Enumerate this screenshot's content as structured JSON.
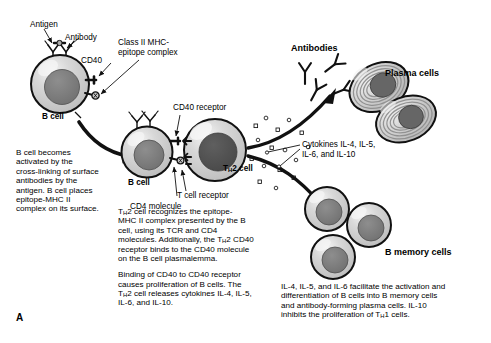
{
  "panel": {
    "label": "A"
  },
  "figure": {
    "title_semantic": "B-cell activation by TH2 cell and differentiation into plasma and memory cells"
  },
  "labels": {
    "antigen": "Antigen",
    "antibody": "Antibody",
    "cd40": "CD40",
    "mhc_complex_line1": "Class II MHC-",
    "mhc_complex_line2": "epitope complex",
    "bcell_1": "B cell",
    "bcell_2": "B cell",
    "cd40_receptor": "CD40 receptor",
    "tcell_receptor": "T cell receptor",
    "cd4_molecule": "CD4 molecule",
    "th2_cell_pre": "T",
    "th2_cell_sub": "H",
    "th2_cell_post": "2 cell",
    "antibodies": "Antibodies",
    "plasma_cells": "Plasma cells",
    "b_memory_cells": "B memory cells",
    "cytokines_line1": "Cytokines IL-4, IL-5,",
    "cytokines_line2": "IL-6, and IL-10"
  },
  "text_blocks": {
    "left": [
      "B cell becomes",
      "activated by the",
      "cross-linking of surface",
      "antibodies by the",
      "antigen. B cell places",
      "epitope-MHC II",
      "complex on its surface."
    ],
    "center_para1": [
      {
        "pre": "T",
        "sub": "H",
        "post": "2 cell recognizes the epitope-"
      },
      {
        "pre": "",
        "sub": "",
        "post": "MHC II complex presented by the B"
      },
      {
        "pre": "",
        "sub": "",
        "post": "cell, using its TCR and CD4"
      },
      {
        "pre": "molecules. Additionally, the T",
        "sub": "H",
        "post": "2 CD40"
      },
      {
        "pre": "",
        "sub": "",
        "post": "receptor binds to the CD40 molecule"
      },
      {
        "pre": "",
        "sub": "",
        "post": "on the B cell plasmalemma."
      }
    ],
    "center_para2": [
      {
        "pre": "",
        "sub": "",
        "post": "Binding of CD40 to CD40 receptor"
      },
      {
        "pre": "",
        "sub": "",
        "post": "causes proliferation of B cells. The"
      },
      {
        "pre": "T",
        "sub": "H",
        "post": "2 cell releases cytokines IL-4, IL-5,"
      },
      {
        "pre": "",
        "sub": "",
        "post": "IL-6, and IL-10."
      }
    ],
    "right": [
      {
        "pre": "",
        "sub": "",
        "post": "IL-4, IL-5, and IL-6 facilitate the activation and"
      },
      {
        "pre": "",
        "sub": "",
        "post": "differentiation of B cells into B memory cells"
      },
      {
        "pre": "",
        "sub": "",
        "post": "and antibody-forming plasma cells. IL-10"
      },
      {
        "pre": "inhibits the proliferation of T",
        "sub": "H",
        "post": "1 cells."
      }
    ]
  },
  "colors": {
    "cytoplasm": "#c9c9c9",
    "cytoplasm_light": "#dedede",
    "nucleus_bcell": "#7d7d7d",
    "nucleus_tcell": "#565656",
    "outline": "#111111",
    "highlight": "#f2f2f2",
    "background": "#ffffff",
    "plasma_er": "#9a9a9a"
  },
  "counts": {
    "antibodies_free": 4,
    "plasma_cells": 2,
    "b_memory_cells": 3,
    "surface_antibodies": 2
  }
}
